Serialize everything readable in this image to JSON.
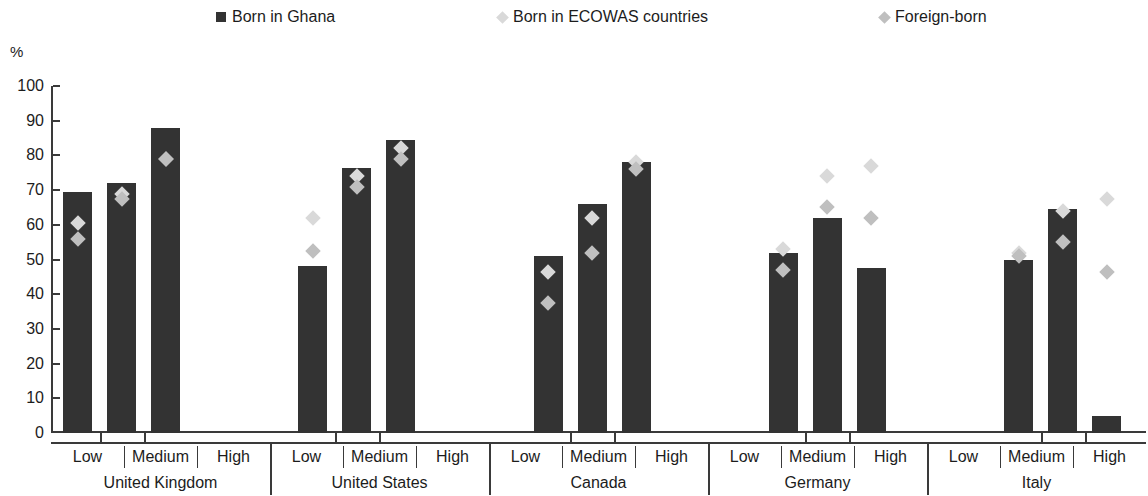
{
  "legend": {
    "items": [
      {
        "label": "Born in Ghana",
        "marker": "square",
        "color": "#333333"
      },
      {
        "label": "Born in ECOWAS countries",
        "marker": "diamond",
        "color": "#d9d9d9"
      },
      {
        "label": "Foreign-born",
        "marker": "diamond",
        "color": "#bfbfbf"
      }
    ]
  },
  "chart_data": {
    "type": "bar",
    "title": "",
    "xlabel": "",
    "ylabel": "%",
    "ylim": [
      0,
      100
    ],
    "yticks": [
      0,
      10,
      20,
      30,
      40,
      50,
      60,
      70,
      80,
      90,
      100
    ],
    "grid": false,
    "legend_position": "top",
    "groups": [
      "United Kingdom",
      "United States",
      "Canada",
      "Germany",
      "Italy"
    ],
    "subcategories": [
      "Low",
      "Medium",
      "High"
    ],
    "categories": [
      "United Kingdom - Low",
      "United Kingdom - Medium",
      "United Kingdom - High",
      "United States - Low",
      "United States - Medium",
      "United States - High",
      "Canada - Low",
      "Canada - Medium",
      "Canada - High",
      "Germany - Low",
      "Germany - Medium",
      "Germany - High",
      "Italy - Low",
      "Italy - Medium",
      "Italy - High"
    ],
    "series": [
      {
        "name": "Born in Ghana",
        "type": "bar",
        "color": "#333333",
        "values": [
          69.5,
          72,
          88,
          48,
          76.5,
          84.5,
          51,
          66,
          78,
          52,
          62,
          47.5,
          50,
          64.5,
          5
        ]
      },
      {
        "name": "Born in ECOWAS countries",
        "type": "scatter",
        "color": "#d9d9d9",
        "values": [
          60.5,
          69,
          79,
          62,
          74,
          82,
          46.5,
          62,
          78,
          53,
          74,
          77,
          52,
          64,
          67.5
        ]
      },
      {
        "name": "Foreign-born",
        "type": "scatter",
        "color": "#bfbfbf",
        "values": [
          56,
          67.5,
          79,
          52.5,
          71,
          79,
          37.5,
          52,
          76,
          47,
          65,
          62,
          51,
          55,
          46.5
        ]
      }
    ]
  }
}
